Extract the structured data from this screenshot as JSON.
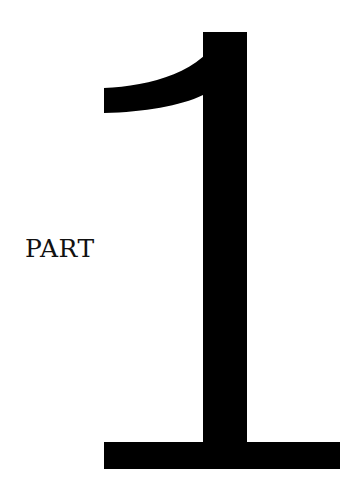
{
  "page": {
    "label": "PART",
    "number": "1",
    "colors": {
      "background": "#ffffff",
      "ink": "#000000",
      "label_ink": "#111111"
    }
  }
}
